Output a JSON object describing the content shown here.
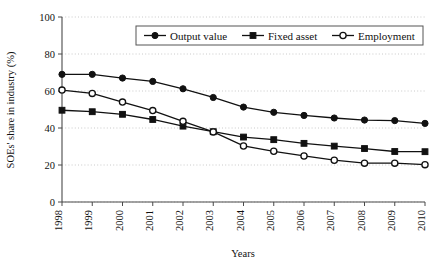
{
  "chart_data": {
    "type": "line",
    "title": "",
    "xlabel": "Years",
    "ylabel": "SOEs' share in industry (%)",
    "categories": [
      "1998",
      "1999",
      "2000",
      "2001",
      "2002",
      "2003",
      "2004",
      "2005",
      "2006",
      "2007",
      "2008",
      "2009",
      "2010"
    ],
    "x": [
      1998,
      1999,
      2000,
      2001,
      2002,
      2003,
      2004,
      2005,
      2006,
      2007,
      2008,
      2009,
      2010
    ],
    "ylim": [
      0,
      100
    ],
    "yticks": [
      0,
      20,
      40,
      60,
      80,
      100
    ],
    "ytick_labels": [
      "0",
      "20",
      "40",
      "60",
      "80",
      "100"
    ],
    "grid": true,
    "grid_axis": "y",
    "legend_position": "top-center",
    "series": [
      {
        "name": "Output value",
        "marker": "filled-circle",
        "values": [
          69.0,
          69.0,
          67.0,
          65.2,
          61.2,
          56.5,
          51.3,
          48.5,
          46.8,
          45.4,
          44.3,
          44.0,
          42.5
        ]
      },
      {
        "name": "Fixed asset",
        "marker": "filled-square",
        "values": [
          49.6,
          48.8,
          47.4,
          44.6,
          41.0,
          38.0,
          35.1,
          33.7,
          31.7,
          30.2,
          28.9,
          27.3,
          27.2
        ]
      },
      {
        "name": "Employment",
        "marker": "open-circle",
        "values": [
          60.5,
          58.7,
          54.0,
          49.4,
          43.6,
          37.9,
          30.3,
          27.4,
          24.9,
          22.6,
          21.0,
          21.0,
          20.2
        ]
      }
    ]
  },
  "axis": {
    "y_title": "SOEs' share in industry (%)",
    "x_title": "Years"
  },
  "legend": {
    "entries": [
      {
        "label": "Output value",
        "marker": "filled-circle"
      },
      {
        "label": "Fixed asset",
        "marker": "filled-square"
      },
      {
        "label": "Employment",
        "marker": "open-circle"
      }
    ]
  },
  "colors": {
    "ink": "#111111",
    "grid": "#bdbdbd",
    "axis": "#4a4a4a",
    "background": "#ffffff"
  }
}
